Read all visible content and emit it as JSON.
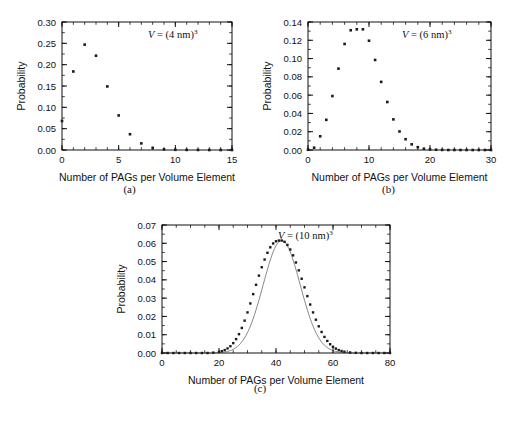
{
  "figure": {
    "panels": [
      {
        "caption": "(a)",
        "annotation": {
          "prefix": "V",
          "equals": " = (4 nm)",
          "exponent": "3"
        },
        "xlabel": "Number of PAGs per Volume Element",
        "ylabel": "Probability",
        "xticks": [
          0,
          5,
          10,
          15
        ],
        "xtick_labels": [
          "0",
          "5",
          "10",
          "15"
        ],
        "yticks": [
          0.0,
          0.05,
          0.1,
          0.15,
          0.2,
          0.25,
          0.3
        ],
        "ytick_labels": [
          "0.00",
          "0.05",
          "0.10",
          "0.15",
          "0.20",
          "0.25",
          "0.30"
        ],
        "xlim": [
          0,
          15
        ],
        "ylim": [
          0,
          0.3
        ],
        "minor_x_step": 1,
        "minor_y_step": 0.025
      },
      {
        "caption": "(b)",
        "annotation": {
          "prefix": "V",
          "equals": " = (6 nm)",
          "exponent": "3"
        },
        "xlabel": "Number of PAGs per Volume Element",
        "ylabel": "Probability",
        "xticks": [
          0,
          10,
          20,
          30
        ],
        "xtick_labels": [
          "0",
          "10",
          "20",
          "30"
        ],
        "yticks": [
          0.0,
          0.02,
          0.04,
          0.06,
          0.08,
          0.1,
          0.12,
          0.14
        ],
        "ytick_labels": [
          "0.00",
          "0.02",
          "0.04",
          "0.06",
          "0.08",
          "0.10",
          "0.12",
          "0.14"
        ],
        "xlim": [
          0,
          30
        ],
        "ylim": [
          0,
          0.14
        ],
        "minor_x_step": 2,
        "minor_y_step": 0.01
      },
      {
        "caption": "(c)",
        "annotation": {
          "prefix": "V",
          "equals": " = (10 nm)",
          "exponent": "3"
        },
        "xlabel": "Number of PAGs per Volume Element",
        "ylabel": "Probability",
        "xticks": [
          0,
          20,
          40,
          60,
          80
        ],
        "xtick_labels": [
          "0",
          "20",
          "40",
          "60",
          "80"
        ],
        "yticks": [
          0.0,
          0.01,
          0.02,
          0.03,
          0.04,
          0.05,
          0.06,
          0.07
        ],
        "ytick_labels": [
          "0.00",
          "0.01",
          "0.02",
          "0.03",
          "0.04",
          "0.05",
          "0.06",
          "0.07"
        ],
        "xlim": [
          0,
          80
        ],
        "ylim": [
          0,
          0.07
        ],
        "minor_x_step": 5,
        "minor_y_step": 0.005
      }
    ]
  },
  "chart_data": [
    {
      "type": "scatter",
      "title": "",
      "panel": "(a)",
      "annotation": "V = (4 nm)^3",
      "xlabel": "Number of PAGs per Volume Element",
      "ylabel": "Probability",
      "xlim": [
        0,
        15
      ],
      "ylim": [
        0,
        0.3
      ],
      "grid": false,
      "legend": "none",
      "marker": "square",
      "x": [
        0,
        1,
        2,
        3,
        4,
        5,
        6,
        7,
        8,
        9,
        10,
        11,
        12,
        13,
        14,
        15
      ],
      "y": [
        0.068,
        0.184,
        0.247,
        0.221,
        0.149,
        0.081,
        0.037,
        0.0155,
        0.005,
        0.0015,
        0.0005,
        0.0002,
        0.0001,
        0.0,
        0.0,
        0.0
      ]
    },
    {
      "type": "scatter",
      "title": "",
      "panel": "(b)",
      "annotation": "V = (6 nm)^3",
      "xlabel": "Number of PAGs per Volume Element",
      "ylabel": "Probability",
      "xlim": [
        0,
        30
      ],
      "ylim": [
        0,
        0.14
      ],
      "grid": false,
      "legend": "none",
      "marker": "square",
      "x": [
        0,
        1,
        2,
        3,
        4,
        5,
        6,
        7,
        8,
        9,
        10,
        11,
        12,
        13,
        14,
        15,
        16,
        17,
        18,
        19,
        20,
        21,
        22,
        23,
        24,
        25,
        26,
        27,
        28,
        29,
        30
      ],
      "y": [
        0.0003,
        0.0025,
        0.015,
        0.033,
        0.059,
        0.089,
        0.116,
        0.131,
        0.132,
        0.132,
        0.1195,
        0.0985,
        0.0745,
        0.0525,
        0.0335,
        0.0203,
        0.0118,
        0.0062,
        0.0031,
        0.0014,
        0.0006,
        0.0003,
        0.0001,
        0.0,
        0.0,
        0.0,
        0.0,
        0.0,
        0.0,
        0.0,
        0.0
      ]
    },
    {
      "type": "scatter",
      "title": "",
      "panel": "(c)",
      "annotation": "V = (10 nm)^3",
      "xlabel": "Number of PAGs per Volume Element",
      "ylabel": "Probability",
      "xlim": [
        0,
        80
      ],
      "ylim": [
        0,
        0.07
      ],
      "grid": false,
      "legend": "none",
      "marker": "square",
      "has_fit_curve": true,
      "peak_x": 42,
      "peak_y": 0.0615,
      "mean": 42,
      "stddev": 6.5,
      "x": [
        0,
        2,
        4,
        6,
        8,
        10,
        12,
        14,
        16,
        18,
        20,
        21,
        22,
        23,
        24,
        25,
        26,
        27,
        28,
        29,
        30,
        31,
        32,
        33,
        34,
        35,
        36,
        37,
        38,
        39,
        40,
        41,
        42,
        43,
        44,
        45,
        46,
        47,
        48,
        49,
        50,
        51,
        52,
        53,
        54,
        55,
        56,
        57,
        58,
        59,
        60,
        61,
        62,
        63,
        64,
        66,
        68,
        70,
        72,
        74,
        76,
        78,
        80
      ],
      "y": [
        0.0,
        0.0,
        0.0,
        0.0,
        0.0,
        0.0,
        0.0,
        0.0,
        0.0,
        0.0002,
        0.0006,
        0.001,
        0.0016,
        0.0025,
        0.0037,
        0.0054,
        0.0076,
        0.0103,
        0.0137,
        0.0177,
        0.0222,
        0.0271,
        0.0322,
        0.0373,
        0.0423,
        0.0469,
        0.0511,
        0.0548,
        0.0578,
        0.0599,
        0.0611,
        0.0615,
        0.0615,
        0.0608,
        0.0591,
        0.0566,
        0.0534,
        0.0495,
        0.0452,
        0.0406,
        0.0359,
        0.0311,
        0.0265,
        0.0222,
        0.0182,
        0.0146,
        0.0115,
        0.0088,
        0.0066,
        0.0048,
        0.0034,
        0.0024,
        0.0016,
        0.0011,
        0.0007,
        0.0003,
        0.0001,
        0.0,
        0.0,
        0.0,
        0.0,
        0.0,
        0.0
      ]
    }
  ]
}
